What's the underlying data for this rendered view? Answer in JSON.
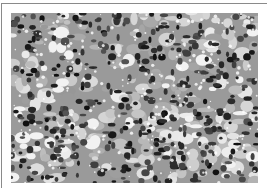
{
  "figure": {
    "type": "histology-micrograph",
    "color_mode": "grayscale",
    "colors": {
      "frame_border": "#8a8a8a",
      "background": "#ffffff",
      "tissue_mid": "#9a9a9a",
      "nuclei_dark": "#1e1e1e",
      "lumen_light": "#f2f2f2"
    }
  }
}
